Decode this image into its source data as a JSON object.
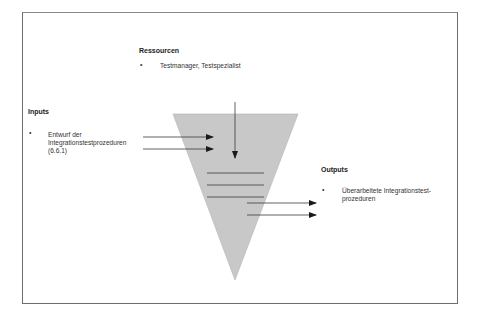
{
  "diagram": {
    "type": "process-funnel",
    "colors": {
      "funnel_fill": "#c8c8c8",
      "funnel_stroke": "#b4b4b4",
      "line": "#3a3a3a",
      "frame": "#6e6e6e"
    },
    "resources": {
      "heading": "Ressourcen",
      "bullet": "•",
      "items": [
        "Testmanager, Testspezialist"
      ]
    },
    "inputs": {
      "heading": "Inputs",
      "bullet": "•",
      "items": [
        {
          "lines": [
            "Entwurf der",
            "Integrationstestprozeduren",
            "(6.6.1)"
          ]
        }
      ]
    },
    "outputs": {
      "heading": "Outputs",
      "bullet": "•",
      "items": [
        {
          "lines": [
            "Überarbeitete Integrationstest-",
            "prozeduren"
          ]
        }
      ]
    }
  }
}
